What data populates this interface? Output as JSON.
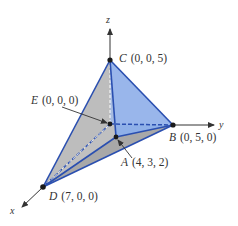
{
  "diagram": {
    "type": "3d-tetrahedron-coordinate-figure",
    "axes": {
      "x": {
        "label": "x"
      },
      "y": {
        "label": "y"
      },
      "z": {
        "label": "z"
      }
    },
    "points": {
      "A": {
        "name": "A",
        "coords": "(4, 3, 2)"
      },
      "B": {
        "name": "B",
        "coords": "(0, 5, 0)"
      },
      "C": {
        "name": "C",
        "coords": "(0, 0, 5)"
      },
      "D": {
        "name": "D",
        "coords": "(7, 0, 0)"
      },
      "E": {
        "name": "E",
        "coords": "(0, 0, 0)"
      }
    },
    "colors": {
      "edge_blue": "#2a4fb0",
      "face_blue": "#8fb0e8",
      "face_gray": "#c8c8c8",
      "face_gray_dark": "#a9a9a9",
      "axis": "#333333"
    }
  }
}
